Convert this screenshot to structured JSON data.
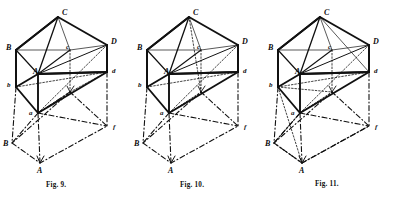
{
  "plate": {
    "description": "Three line-engraved solid-geometry figures of an oblique triangular prism with its projections, drawn side by side on a white page.",
    "ink_color": "#111111",
    "paper_color": "#ffffff",
    "figure_count": 3
  },
  "figures": [
    {
      "id": "fig-9",
      "caption": "Fig. 9.",
      "caption_pos": {
        "x": 46,
        "y": 181
      },
      "origin": {
        "x": 0,
        "y": 0
      },
      "vertices": [
        {
          "label": "C",
          "case": "upper",
          "x": 62,
          "y": 9,
          "pt": [
            58,
            17
          ]
        },
        {
          "label": "D",
          "case": "upper",
          "x": 111,
          "y": 38,
          "pt": [
            107,
            45
          ]
        },
        {
          "label": "B",
          "case": "upper",
          "x": 6,
          "y": 44,
          "pt": [
            16,
            50
          ]
        },
        {
          "label": "c",
          "case": "lower",
          "x": 66,
          "y": 44,
          "pt": [
            70,
            50
          ]
        },
        {
          "label": "d",
          "case": "lower",
          "x": 112,
          "y": 68,
          "pt": [
            107,
            72
          ]
        },
        {
          "label": "A",
          "case": "upper",
          "x": 33,
          "y": 68,
          "pt": [
            38,
            74
          ]
        },
        {
          "label": "b",
          "case": "lower",
          "x": 7,
          "y": 82,
          "pt": [
            16,
            87
          ]
        },
        {
          "label": "a",
          "case": "lower",
          "x": 29,
          "y": 110,
          "pt": [
            38,
            113
          ]
        },
        {
          "label": "f",
          "case": "lower",
          "x": 113,
          "y": 124,
          "pt": [
            107,
            126
          ]
        },
        {
          "label": "B",
          "case": "upper",
          "x": 3,
          "y": 140,
          "pt": [
            12,
            143
          ]
        },
        {
          "label": "A",
          "case": "upper",
          "x": 37,
          "y": 167,
          "pt": [
            40,
            163
          ]
        }
      ]
    },
    {
      "id": "fig-10",
      "caption": "Fig. 10.",
      "caption_pos": {
        "x": 180,
        "y": 181
      },
      "origin": {
        "x": 131,
        "y": 0
      },
      "vertices": [
        {
          "label": "C",
          "case": "upper",
          "x": 62,
          "y": 9,
          "pt": [
            58,
            17
          ]
        },
        {
          "label": "D",
          "case": "upper",
          "x": 111,
          "y": 38,
          "pt": [
            107,
            45
          ]
        },
        {
          "label": "B",
          "case": "upper",
          "x": 6,
          "y": 44,
          "pt": [
            16,
            50
          ]
        },
        {
          "label": "c",
          "case": "lower",
          "x": 66,
          "y": 44,
          "pt": [
            70,
            50
          ]
        },
        {
          "label": "d",
          "case": "lower",
          "x": 112,
          "y": 68,
          "pt": [
            107,
            72
          ]
        },
        {
          "label": "A",
          "case": "upper",
          "x": 33,
          "y": 68,
          "pt": [
            38,
            74
          ]
        },
        {
          "label": "b",
          "case": "lower",
          "x": 7,
          "y": 82,
          "pt": [
            16,
            87
          ]
        },
        {
          "label": "a",
          "case": "lower",
          "x": 29,
          "y": 110,
          "pt": [
            38,
            113
          ]
        },
        {
          "label": "f",
          "case": "lower",
          "x": 113,
          "y": 124,
          "pt": [
            107,
            126
          ]
        },
        {
          "label": "B",
          "case": "upper",
          "x": 3,
          "y": 140,
          "pt": [
            12,
            143
          ]
        },
        {
          "label": "A",
          "case": "upper",
          "x": 37,
          "y": 167,
          "pt": [
            40,
            163
          ]
        }
      ]
    },
    {
      "id": "fig-11",
      "caption": "Fig. 11.",
      "caption_pos": {
        "x": 315,
        "y": 180
      },
      "origin": {
        "x": 262,
        "y": 0
      },
      "vertices": [
        {
          "label": "C",
          "case": "upper",
          "x": 62,
          "y": 9,
          "pt": [
            58,
            17
          ]
        },
        {
          "label": "D",
          "case": "upper",
          "x": 111,
          "y": 38,
          "pt": [
            107,
            45
          ]
        },
        {
          "label": "B",
          "case": "upper",
          "x": 6,
          "y": 44,
          "pt": [
            16,
            50
          ]
        },
        {
          "label": "c",
          "case": "lower",
          "x": 66,
          "y": 44,
          "pt": [
            70,
            50
          ]
        },
        {
          "label": "d",
          "case": "lower",
          "x": 112,
          "y": 68,
          "pt": [
            107,
            72
          ]
        },
        {
          "label": "A",
          "case": "upper",
          "x": 33,
          "y": 68,
          "pt": [
            38,
            74
          ]
        },
        {
          "label": "b",
          "case": "lower",
          "x": 7,
          "y": 82,
          "pt": [
            16,
            87
          ]
        },
        {
          "label": "a",
          "case": "lower",
          "x": 29,
          "y": 110,
          "pt": [
            38,
            113
          ]
        },
        {
          "label": "f",
          "case": "lower",
          "x": 113,
          "y": 124,
          "pt": [
            107,
            126
          ]
        },
        {
          "label": "B",
          "case": "upper",
          "x": 3,
          "y": 140,
          "pt": [
            12,
            143
          ]
        },
        {
          "label": "A",
          "case": "upper",
          "x": 37,
          "y": 167,
          "pt": [
            40,
            163
          ]
        }
      ]
    }
  ]
}
